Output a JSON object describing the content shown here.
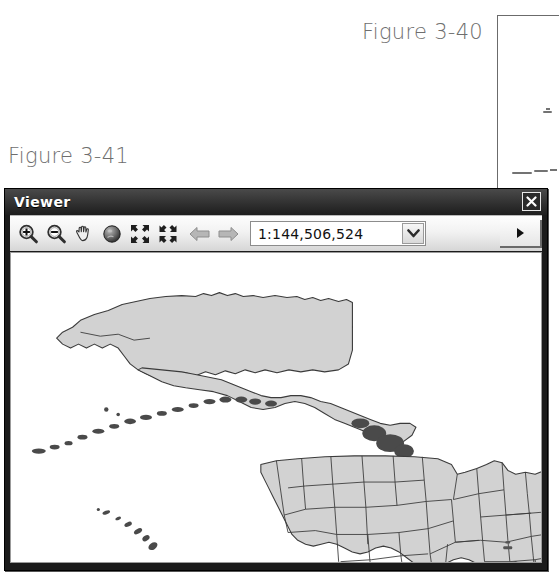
{
  "captions": {
    "figure_3_40": "Figure 3-40",
    "figure_3_41": "Figure 3-41"
  },
  "background_panel": {
    "name": "figure-3-40-partial-window"
  },
  "viewer_window": {
    "title": "Viewer",
    "close_label": "✕",
    "toolbar": {
      "buttons": [
        {
          "name": "zoom-in-icon",
          "label": "Zoom In",
          "state": "enabled"
        },
        {
          "name": "zoom-out-icon",
          "label": "Zoom Out",
          "state": "enabled"
        },
        {
          "name": "pan-hand-icon",
          "label": "Pan",
          "state": "enabled"
        },
        {
          "name": "globe-icon",
          "label": "Globe View",
          "state": "enabled"
        },
        {
          "name": "zoom-to-fit-icon",
          "label": "Contract View",
          "state": "enabled"
        },
        {
          "name": "expand-view-icon",
          "label": "Expand View",
          "state": "enabled"
        },
        {
          "name": "back-arrow-icon",
          "label": "Previous Extent",
          "state": "disabled"
        },
        {
          "name": "forward-arrow-icon",
          "label": "Next Extent",
          "state": "disabled"
        }
      ],
      "scale_combo": {
        "value": "1:144,506,524",
        "placeholder": "1:1",
        "options": [
          "1:144,506,524"
        ]
      },
      "overflow_label": "▶"
    },
    "map": {
      "layers": [
        "Alaska",
        "Conterminous United States",
        "Hawaii"
      ],
      "fill_color": "#d2d2d2",
      "outline_color": "#3b3b3b"
    }
  }
}
